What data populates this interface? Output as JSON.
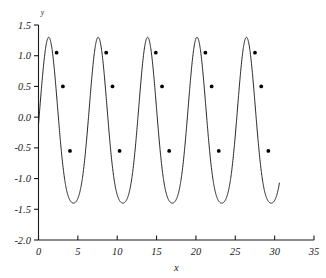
{
  "chart_data": {
    "type": "line",
    "title": "",
    "xlabel": "x",
    "ylabel": "y",
    "xlim": [
      0,
      35
    ],
    "ylim": [
      -2.0,
      1.5
    ],
    "grid": false,
    "legend": null,
    "xticks": [
      0,
      5,
      10,
      15,
      20,
      25,
      30,
      35
    ],
    "xticklabels": [
      "0",
      "5",
      "10",
      "15",
      "20",
      "25",
      "30",
      "35"
    ],
    "yticks": [
      -2.0,
      -1.5,
      -1.0,
      -0.5,
      0.0,
      0.5,
      1.0,
      1.5
    ],
    "yticklabels": [
      "-2.0",
      "-1.5",
      "-1.0",
      "-0.5",
      "0.0",
      "0.5",
      "1.0",
      "1.5"
    ],
    "line_color": "#1a1a1a",
    "marker_color": "#000000",
    "series": [
      {
        "name": "curve",
        "description": "periodic oscillation, period about 6.28, peaks near 1.30, troughs near -1.40, troughs broader than peaks",
        "period": 6.28,
        "peak_value": 1.3,
        "trough_value": -1.4,
        "x_start": 0.0,
        "x_end": 30.6,
        "peaks_x": [
          1.3,
          7.6,
          13.9,
          20.2,
          26.5
        ],
        "troughs_x": [
          4.4,
          10.7,
          17.0,
          23.3,
          29.6
        ],
        "markers": [
          {
            "x": 2.3,
            "y": 1.05
          },
          {
            "x": 3.1,
            "y": 0.5
          },
          {
            "x": 4.0,
            "y": -0.55
          },
          {
            "x": 8.6,
            "y": 1.05
          },
          {
            "x": 9.4,
            "y": 0.5
          },
          {
            "x": 10.3,
            "y": -0.55
          },
          {
            "x": 14.9,
            "y": 1.05
          },
          {
            "x": 15.7,
            "y": 0.5
          },
          {
            "x": 16.6,
            "y": -0.55
          },
          {
            "x": 21.2,
            "y": 1.05
          },
          {
            "x": 22.0,
            "y": 0.5
          },
          {
            "x": 22.9,
            "y": -0.55
          },
          {
            "x": 27.5,
            "y": 1.05
          },
          {
            "x": 28.3,
            "y": 0.5
          },
          {
            "x": 29.2,
            "y": -0.55
          }
        ]
      }
    ]
  }
}
